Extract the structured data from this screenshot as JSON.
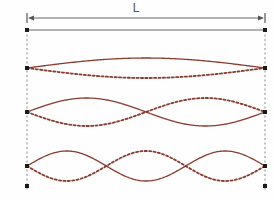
{
  "figure": {
    "background_color": "#fefefe",
    "wave_color": "#8a3a2e",
    "dimension_color": "#666666",
    "guide_color": "#888888",
    "label_color": "#555555"
  },
  "dimension": {
    "label": "L",
    "label_x": 136,
    "label_y": 12,
    "line_y": 18,
    "left_x": 27,
    "right_x": 265,
    "arrow_style": "double-headed",
    "tick_style": "vertical-bar"
  },
  "string_baseline": {
    "y": 30,
    "left_x": 27,
    "right_x": 265,
    "stroke": "#666666"
  },
  "boundaries": {
    "left_x": 27,
    "right_x": 265,
    "top_y": 30,
    "bottom_y": 190,
    "style": "dashed",
    "stroke": "#888888"
  },
  "node_markers": {
    "size": 4,
    "color": "#1a1a1a",
    "positions": [
      {
        "x": 27,
        "y": 30
      },
      {
        "x": 265,
        "y": 30
      },
      {
        "x": 27,
        "y": 68
      },
      {
        "x": 265,
        "y": 68
      },
      {
        "x": 27,
        "y": 112
      },
      {
        "x": 265,
        "y": 112
      },
      {
        "x": 27,
        "y": 166
      },
      {
        "x": 265,
        "y": 166
      },
      {
        "x": 27,
        "y": 186
      },
      {
        "x": 265,
        "y": 186
      }
    ]
  },
  "chart_data": {
    "type": "line",
    "xlabel": "Position along string",
    "ylabel": "Displacement",
    "x_range_label": "L",
    "x_start": 27,
    "x_end": 265,
    "grid": false,
    "legend": "none",
    "annotations": [
      "L"
    ],
    "series": [
      {
        "name": "Fundamental (n = 1)",
        "harmonic": 1,
        "half_wavelengths": 1,
        "antinodes": 1,
        "interior_nodes": 0,
        "axis_y": 68,
        "amplitude": 10,
        "solid_phase": "positive",
        "dashed_phase": "negative",
        "node_x_positions": [
          27,
          265
        ],
        "antinode_x_positions": [
          146
        ]
      },
      {
        "name": "Second harmonic (n = 2)",
        "harmonic": 2,
        "half_wavelengths": 2,
        "antinodes": 2,
        "interior_nodes": 1,
        "axis_y": 112,
        "amplitude": 14,
        "solid_phase": "positive",
        "dashed_phase": "negative",
        "node_x_positions": [
          27,
          146,
          265
        ],
        "antinode_x_positions": [
          86,
          206
        ]
      },
      {
        "name": "Third harmonic (n = 3)",
        "harmonic": 3,
        "half_wavelengths": 3,
        "antinodes": 3,
        "interior_nodes": 2,
        "axis_y": 166,
        "amplitude": 15,
        "solid_phase": "positive",
        "dashed_phase": "negative",
        "node_x_positions": [
          27,
          106,
          186,
          265
        ],
        "antinode_x_positions": [
          66,
          146,
          226
        ]
      }
    ]
  }
}
